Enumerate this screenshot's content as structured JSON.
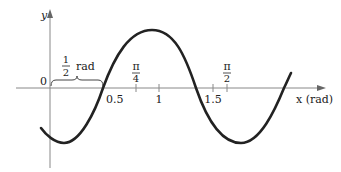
{
  "diagram": {
    "axes": {
      "y_label": "y",
      "x_label": "x (rad)",
      "origin_label": "0"
    },
    "x_ticks": [
      {
        "label": "0.5",
        "position": "below"
      },
      {
        "label_num": "π",
        "label_den": "4",
        "position": "above"
      },
      {
        "label": "1",
        "position": "below"
      },
      {
        "label": "1.5",
        "position": "below"
      },
      {
        "label_num": "π",
        "label_den": "2",
        "position": "above"
      }
    ],
    "brace": {
      "label_num": "1",
      "label_den": "2",
      "label_unit": "rad"
    },
    "colors": {
      "curve": "#222222",
      "axes": "#888888",
      "text": "#222222"
    }
  }
}
